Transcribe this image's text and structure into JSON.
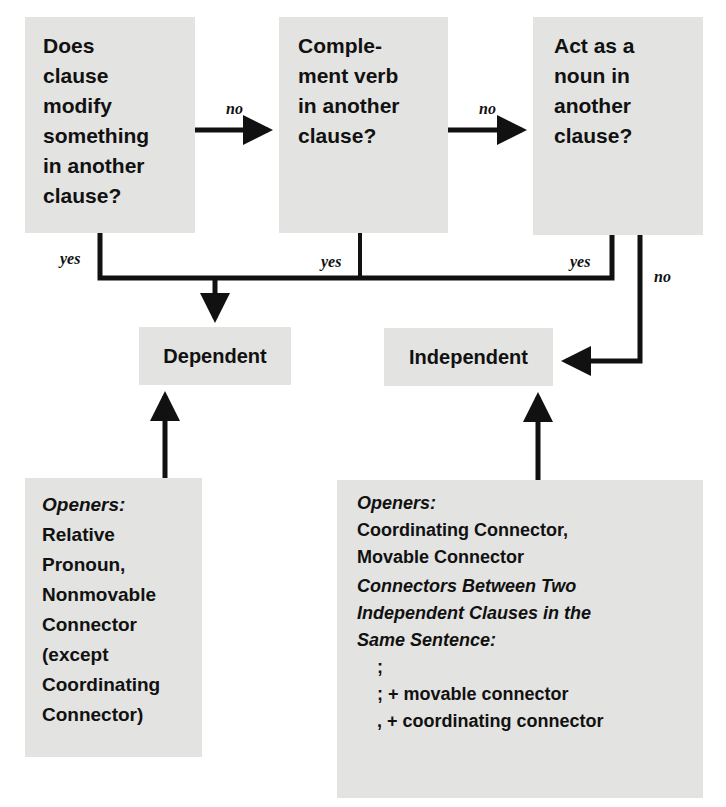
{
  "questions": [
    {
      "id": "q1",
      "lines": [
        "Does",
        "clause",
        "modify",
        "something",
        "in another",
        "clause?"
      ]
    },
    {
      "id": "q2",
      "lines": [
        "Comple-",
        "ment verb",
        "in another",
        "clause?"
      ]
    },
    {
      "id": "q3",
      "lines": [
        "Act as a",
        "noun in",
        "another",
        "clause?"
      ]
    }
  ],
  "edge_labels": {
    "q1_to_q2": "no",
    "q2_to_q3": "no",
    "q1_yes": "yes",
    "q2_yes": "yes",
    "q3_yes": "yes",
    "q3_no": "no"
  },
  "outcomes": {
    "dependent": "Dependent",
    "independent": "Independent"
  },
  "dependent_openers": {
    "heading": "Openers:",
    "lines": [
      "Relative",
      "Pronoun,",
      "Nonmovable",
      "Connector",
      "(except",
      "Coordinating",
      "Connector)"
    ]
  },
  "independent_openers": {
    "heading": "Openers:",
    "lines": [
      "Coordinating Connector,",
      "Movable Connector"
    ],
    "subheading_lines": [
      "Connectors Between Two",
      "Independent Clauses in the",
      "Same Sentence:"
    ],
    "connectors": [
      ";",
      "; + movable connector",
      ", + coordinating connector"
    ]
  },
  "colors": {
    "box_fill": "#e3e3e1",
    "line": "#111111",
    "background": "#ffffff"
  }
}
